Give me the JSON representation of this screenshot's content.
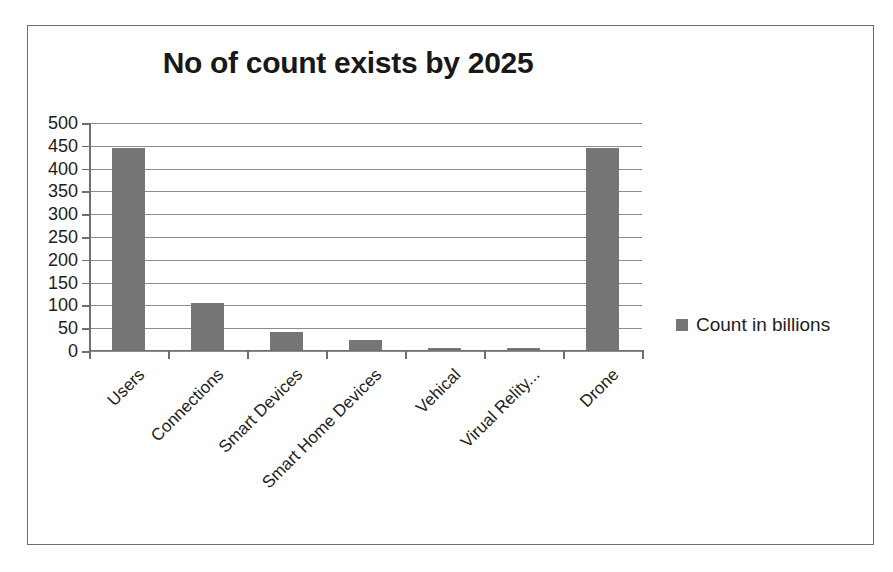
{
  "chart_data": {
    "type": "bar",
    "title": "No of count exists by 2025",
    "xlabel": "",
    "ylabel": "",
    "categories": [
      "Users",
      "Connections",
      "Smart Devices",
      "Smart Home Devices",
      "Vehical",
      "Virual Relity...",
      "Drone"
    ],
    "values": [
      441,
      102,
      38,
      21,
      3,
      4,
      443
    ],
    "series": [
      {
        "name": "Count in billions",
        "values": [
          441,
          102,
          38,
          21,
          3,
          4,
          443
        ],
        "color": "#767676"
      }
    ],
    "ylim": [
      0,
      500
    ],
    "ytick_step": 50,
    "yticks": [
      500,
      450,
      400,
      350,
      300,
      250,
      200,
      150,
      100,
      50,
      0
    ],
    "ytick_labels": [
      "500",
      "450",
      "400",
      "350",
      "300",
      "250",
      "200",
      "150",
      "100",
      "50",
      "0"
    ],
    "grid": true,
    "grid_axis": "y",
    "legend": {
      "position": "right",
      "entries": [
        {
          "label": "Count in billions",
          "marker": "square",
          "color": "#767676"
        }
      ]
    },
    "bar_color": "#767676",
    "axis_color": "#6f6f6f",
    "gridline_color": "#8c8c8c",
    "background": "#ffffff",
    "border_color": "#6f6f6f",
    "xtick_label_rotation": -45
  }
}
